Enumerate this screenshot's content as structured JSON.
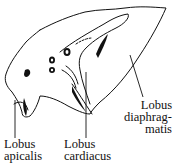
{
  "figure": {
    "type": "anatomical line drawing",
    "stroke_color": "#111111",
    "background": "#ffffff"
  },
  "labels": {
    "apicalis": {
      "line1": "Lobus",
      "line2": "apicalis"
    },
    "cardiacus": {
      "line1": "Lobus",
      "line2": "cardiacus"
    },
    "diaphragmatis": {
      "line1": "Lobus",
      "line2": "diaphrag-",
      "line3": "matis"
    }
  }
}
